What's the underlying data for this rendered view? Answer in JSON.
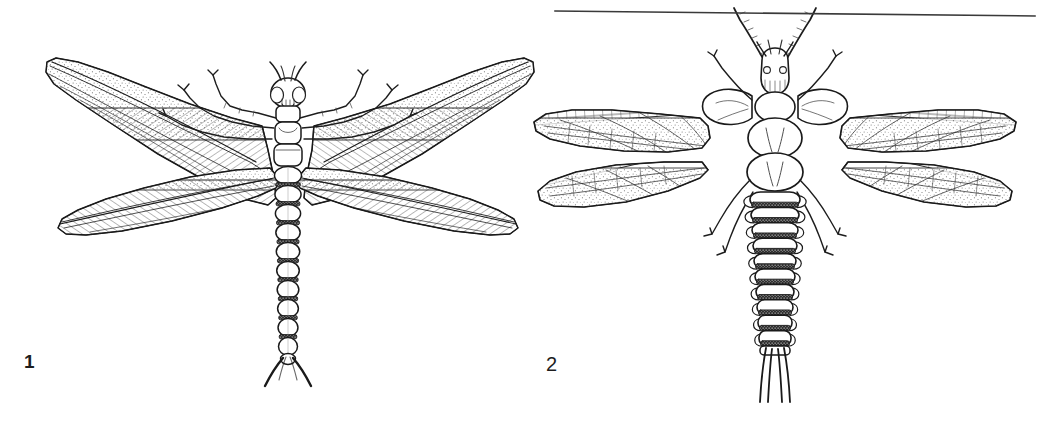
{
  "plate": {
    "width": 1051,
    "height": 425,
    "background_color": "#ffffff",
    "ink_color": "#1d1d1d",
    "style": "black-and-white scientific line drawing / stipple engraving",
    "rule": {
      "name": "top-horizontal-rule",
      "x_start": 555,
      "y_start": 11,
      "x_end": 1035,
      "y_end": 16,
      "stroke_width": 1.6,
      "color": "#3a3a3a"
    }
  },
  "figures": [
    {
      "id": "figure-1",
      "label": "1",
      "label_x": 24,
      "label_y": 352,
      "subject": "dragonfly-like insect, dorsal view, wings spread",
      "body_center_x": 288,
      "head_y": 78,
      "tail_y": 386,
      "wingspan_left_x": 45,
      "wingspan_right_x": 525,
      "abdomen_segments": 10,
      "leg_pairs": 3,
      "antennae": "short horn-like, 2",
      "cerci": "two short curved forceps-like appendages",
      "wing_pairs": 2,
      "wing_texture": "dense parallel hatching with stippled leading margin"
    },
    {
      "id": "figure-2",
      "label": "2",
      "label_x": 546,
      "label_y": 354,
      "subject": "stonefly-like insect, dorsal view, wings spread horizontally",
      "body_center_x": 775,
      "head_y": 58,
      "tail_y": 402,
      "wingspan_left_x": 533,
      "wingspan_right_x": 1010,
      "abdomen_segments": 10,
      "leg_pairs": 3,
      "antennae": "two long segmented antennae",
      "cerci": "two long parallel caudal filaments",
      "wing_pairs": 2,
      "wing_texture": "cross-vein ladder along costal margin with stippled membrane",
      "lateral_gills": "leaf-like lateral gill lobes on abdominal segments"
    }
  ]
}
